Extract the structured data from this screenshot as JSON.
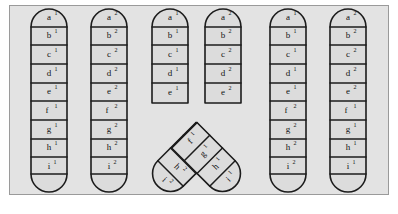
{
  "figure": {
    "background_color": "#ffffff",
    "panel_color": "#e3e3e3",
    "panel_border_color": "#9a9a9a",
    "chromatid_fill": "#dcdcdc",
    "chromatid_stroke": "#1c1c1c",
    "locus_order": [
      "a",
      "b",
      "c",
      "d",
      "e",
      "f",
      "g",
      "h",
      "i"
    ],
    "columns": [
      {
        "id": "col-1",
        "group": "before",
        "shape": "straight",
        "labels": [
          {
            "letter": "a",
            "sup": "1"
          },
          {
            "letter": "b",
            "sup": "1"
          },
          {
            "letter": "c",
            "sup": "1"
          },
          {
            "letter": "d",
            "sup": "1"
          },
          {
            "letter": "e",
            "sup": "1"
          },
          {
            "letter": "f",
            "sup": "1"
          },
          {
            "letter": "g",
            "sup": "1"
          },
          {
            "letter": "h",
            "sup": "1"
          },
          {
            "letter": "i",
            "sup": "1"
          }
        ]
      },
      {
        "id": "col-2",
        "group": "before",
        "shape": "straight",
        "labels": [
          {
            "letter": "a",
            "sup": "2"
          },
          {
            "letter": "b",
            "sup": "2"
          },
          {
            "letter": "c",
            "sup": "2"
          },
          {
            "letter": "d",
            "sup": "2"
          },
          {
            "letter": "e",
            "sup": "2"
          },
          {
            "letter": "f",
            "sup": "2"
          },
          {
            "letter": "g",
            "sup": "2"
          },
          {
            "letter": "h",
            "sup": "2"
          },
          {
            "letter": "i",
            "sup": "2"
          }
        ]
      },
      {
        "id": "col-3",
        "group": "crossing",
        "shape": "bent-left",
        "labels": [
          {
            "letter": "a",
            "sup": "1"
          },
          {
            "letter": "b",
            "sup": "1"
          },
          {
            "letter": "c",
            "sup": "1"
          },
          {
            "letter": "d",
            "sup": "1"
          },
          {
            "letter": "e",
            "sup": "1"
          },
          {
            "letter": "f",
            "sup": "1"
          },
          {
            "letter": "g",
            "sup": "1"
          },
          {
            "letter": "h",
            "sup": "2"
          },
          {
            "letter": "i",
            "sup": "2"
          }
        ]
      },
      {
        "id": "col-4",
        "group": "crossing",
        "shape": "bent-right",
        "labels": [
          {
            "letter": "a",
            "sup": "2"
          },
          {
            "letter": "b",
            "sup": "2"
          },
          {
            "letter": "c",
            "sup": "2"
          },
          {
            "letter": "d",
            "sup": "2"
          },
          {
            "letter": "e",
            "sup": "2"
          },
          {
            "letter": "f",
            "sup": "2"
          },
          {
            "letter": "g",
            "sup": "2"
          },
          {
            "letter": "h",
            "sup": "1"
          },
          {
            "letter": "i",
            "sup": "1"
          }
        ]
      },
      {
        "id": "col-5",
        "group": "after",
        "shape": "straight",
        "labels": [
          {
            "letter": "a",
            "sup": "1"
          },
          {
            "letter": "b",
            "sup": "1"
          },
          {
            "letter": "c",
            "sup": "1"
          },
          {
            "letter": "d",
            "sup": "1"
          },
          {
            "letter": "e",
            "sup": "1"
          },
          {
            "letter": "f",
            "sup": "2"
          },
          {
            "letter": "g",
            "sup": "2"
          },
          {
            "letter": "h",
            "sup": "2"
          },
          {
            "letter": "i",
            "sup": "2"
          }
        ]
      },
      {
        "id": "col-6",
        "group": "after",
        "shape": "straight",
        "labels": [
          {
            "letter": "a",
            "sup": "2"
          },
          {
            "letter": "b",
            "sup": "2"
          },
          {
            "letter": "c",
            "sup": "2"
          },
          {
            "letter": "d",
            "sup": "2"
          },
          {
            "letter": "e",
            "sup": "2"
          },
          {
            "letter": "f",
            "sup": "1"
          },
          {
            "letter": "g",
            "sup": "1"
          },
          {
            "letter": "h",
            "sup": "1"
          },
          {
            "letter": "i",
            "sup": "1"
          }
        ]
      }
    ]
  }
}
